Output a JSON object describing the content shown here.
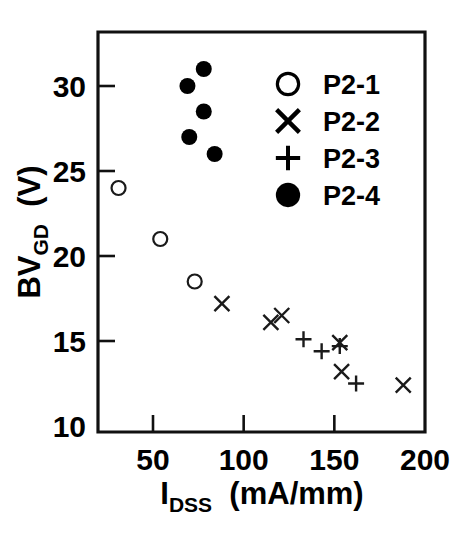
{
  "chart_data": {
    "type": "scatter",
    "title": "",
    "xlabel": "I DSS  (mA/mm)",
    "xlabel_main": "I",
    "xlabel_sub": "DSS",
    "xlabel_units": "(mA/mm)",
    "ylabel": "BV GD  (V)",
    "ylabel_main": "BV",
    "ylabel_sub": "GD",
    "ylabel_units": "(V)",
    "xlim": [
      20,
      200
    ],
    "ylim": [
      10,
      32
    ],
    "xticks": [
      50,
      100,
      150,
      200
    ],
    "xticklabels": [
      "50",
      "100",
      "150",
      "200"
    ],
    "yticks": [
      30,
      25,
      20,
      15,
      10
    ],
    "yticklabels": [
      "30",
      "25",
      "20",
      "15",
      "10"
    ],
    "grid": false,
    "legend_position": "upper right",
    "series": [
      {
        "name": "P2-1",
        "marker": "open-circle",
        "points": [
          {
            "x": 31,
            "y": 24.0
          },
          {
            "x": 54,
            "y": 21.0
          },
          {
            "x": 73,
            "y": 18.5
          }
        ]
      },
      {
        "name": "P2-2",
        "marker": "cross",
        "points": [
          {
            "x": 88,
            "y": 17.2
          },
          {
            "x": 115,
            "y": 16.1
          },
          {
            "x": 121,
            "y": 16.5
          },
          {
            "x": 153,
            "y": 14.9
          },
          {
            "x": 154,
            "y": 13.2
          },
          {
            "x": 188,
            "y": 12.4
          }
        ]
      },
      {
        "name": "P2-3",
        "marker": "plus",
        "points": [
          {
            "x": 133,
            "y": 15.1
          },
          {
            "x": 143,
            "y": 14.4
          },
          {
            "x": 153,
            "y": 14.7
          },
          {
            "x": 162,
            "y": 12.5
          }
        ]
      },
      {
        "name": "P2-4",
        "marker": "filled-circle",
        "points": [
          {
            "x": 69,
            "y": 30.0
          },
          {
            "x": 78,
            "y": 31.0
          },
          {
            "x": 78,
            "y": 28.5
          },
          {
            "x": 70,
            "y": 27.0
          },
          {
            "x": 84,
            "y": 26.0
          }
        ]
      }
    ]
  },
  "legend": {
    "entries": [
      {
        "label": "P2-1",
        "marker": "open-circle"
      },
      {
        "label": "P2-2",
        "marker": "cross"
      },
      {
        "label": "P2-3",
        "marker": "plus"
      },
      {
        "label": "P2-4",
        "marker": "filled-circle"
      }
    ]
  },
  "colors": {
    "ink": "#000000",
    "axis": "#111111",
    "marker": "#1a1a1a",
    "background": "#ffffff"
  }
}
